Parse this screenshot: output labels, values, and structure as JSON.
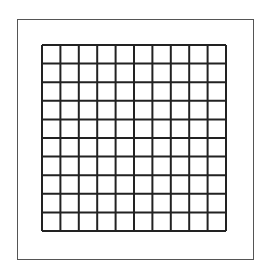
{
  "diagram": {
    "type": "grid",
    "rows": 10,
    "columns": 10,
    "grid_line_color": "#222222",
    "frame_color": "#555555",
    "background": "#ffffff",
    "label": "10x10 empty grid inside a square frame"
  }
}
